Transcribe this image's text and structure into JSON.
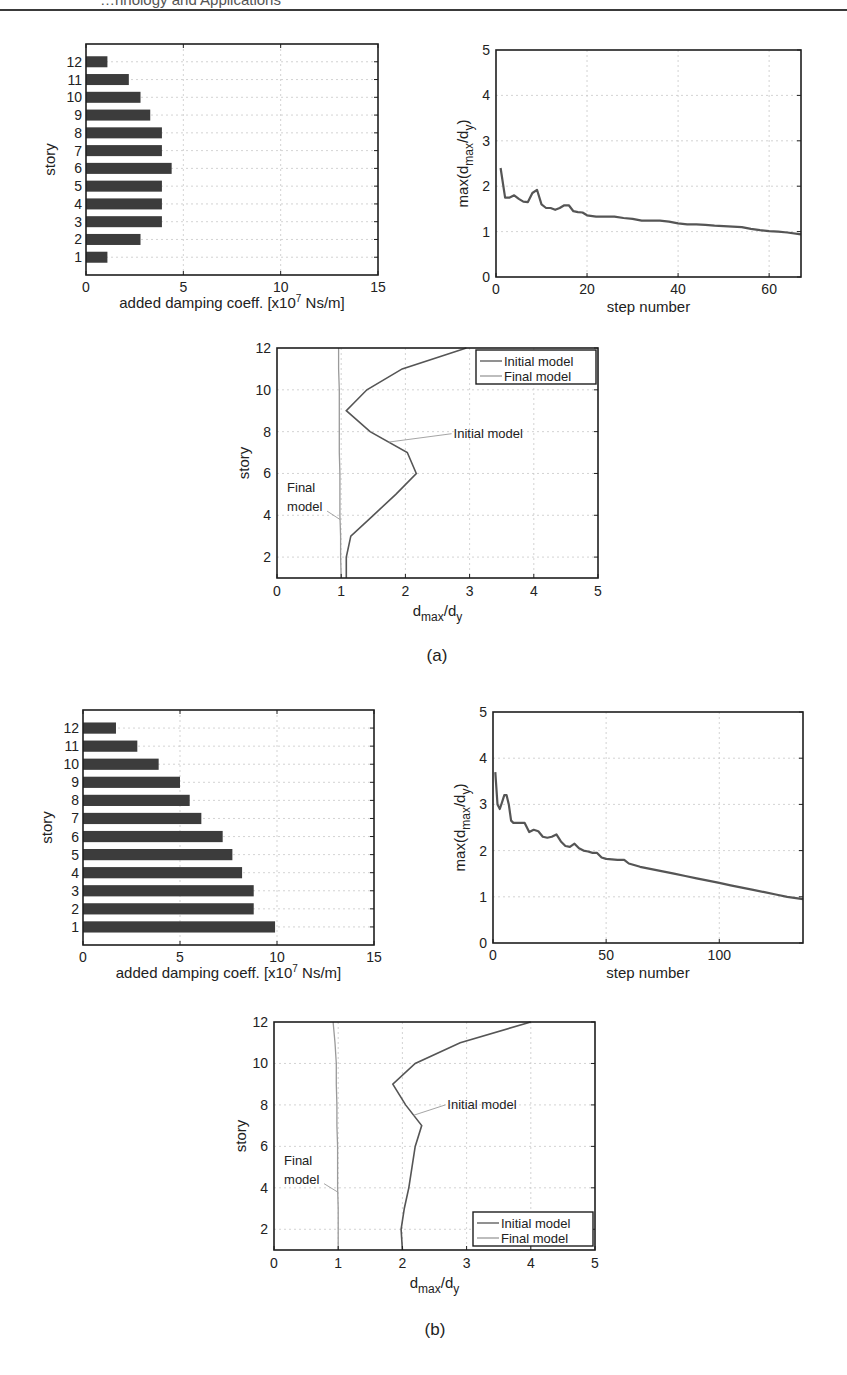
{
  "page": {
    "header_text": "…hnology and Applications",
    "figure_a_caption": "(a)",
    "figure_b_caption": "(b)"
  },
  "chart_data": [
    {
      "id": "a_bar",
      "panel": "a",
      "type": "bar",
      "orientation": "horizontal",
      "title": "",
      "xlabel": "added damping coeff. [x10^7 Ns/m]",
      "ylabel": "story",
      "xlim": [
        0,
        15
      ],
      "xticks": [
        0,
        5,
        10,
        15
      ],
      "categories": [
        "1",
        "2",
        "3",
        "4",
        "5",
        "6",
        "7",
        "8",
        "9",
        "10",
        "11",
        "12"
      ],
      "values": [
        1.1,
        2.8,
        3.9,
        3.9,
        3.9,
        4.4,
        3.9,
        3.9,
        3.3,
        2.8,
        2.2,
        1.1
      ],
      "grid": true,
      "box": {
        "left": 86,
        "top": 44,
        "right": 378,
        "bottom": 275
      }
    },
    {
      "id": "a_line",
      "panel": "a",
      "type": "line",
      "xlabel": "step number",
      "ylabel": "max(d_max/d_y)",
      "xlim": [
        0,
        67
      ],
      "ylim": [
        0,
        5
      ],
      "xticks": [
        0,
        20,
        40,
        60
      ],
      "yticks": [
        0,
        1,
        2,
        3,
        4,
        5
      ],
      "grid": true,
      "x": [
        1,
        2,
        3,
        4,
        5,
        6,
        7,
        8,
        9,
        10,
        11,
        12,
        13,
        14,
        15,
        16,
        17,
        18,
        19,
        20,
        22,
        24,
        26,
        28,
        30,
        32,
        34,
        36,
        38,
        40,
        42,
        44,
        46,
        48,
        50,
        52,
        54,
        56,
        58,
        60,
        62,
        64,
        67
      ],
      "values": [
        2.4,
        1.75,
        1.75,
        1.8,
        1.72,
        1.66,
        1.65,
        1.85,
        1.92,
        1.6,
        1.52,
        1.52,
        1.48,
        1.52,
        1.58,
        1.58,
        1.45,
        1.43,
        1.42,
        1.36,
        1.33,
        1.33,
        1.33,
        1.3,
        1.28,
        1.24,
        1.24,
        1.24,
        1.22,
        1.18,
        1.16,
        1.16,
        1.15,
        1.13,
        1.12,
        1.11,
        1.1,
        1.06,
        1.03,
        1.01,
        1.0,
        0.98,
        0.94
      ],
      "box": {
        "left": 496,
        "top": 50,
        "right": 801,
        "bottom": 277
      }
    },
    {
      "id": "a_profile",
      "panel": "a",
      "type": "line",
      "xlabel": "d_max/d_y",
      "ylabel": "story",
      "xlim": [
        0,
        5
      ],
      "ylim": [
        1,
        12
      ],
      "xticks": [
        0,
        1,
        2,
        3,
        4,
        5
      ],
      "yticks": [
        2,
        4,
        6,
        8,
        10,
        12
      ],
      "grid": true,
      "legend": {
        "position": "upper right",
        "entries": [
          "Initial model",
          "Final model"
        ]
      },
      "annotations": [
        {
          "text": "Initial model",
          "at": [
            2.75,
            7.9
          ]
        },
        {
          "text": "Final",
          "at": [
            0.25,
            5.3
          ]
        },
        {
          "text": "model",
          "at": [
            0.25,
            4.4
          ]
        }
      ],
      "y": [
        1,
        2,
        3,
        4,
        5,
        6,
        7,
        8,
        9,
        10,
        11,
        12
      ],
      "series": [
        {
          "name": "Initial model",
          "values": [
            1.08,
            1.08,
            1.15,
            1.5,
            1.85,
            2.17,
            2.03,
            1.45,
            1.08,
            1.4,
            1.95,
            2.95
          ]
        },
        {
          "name": "Final model",
          "values": [
            1.0,
            0.99,
            0.99,
            0.98,
            0.98,
            0.98,
            0.97,
            0.97,
            0.97,
            0.97,
            0.96,
            0.96
          ]
        }
      ],
      "box": {
        "left": 277,
        "top": 348,
        "right": 598,
        "bottom": 578
      }
    },
    {
      "id": "b_bar",
      "panel": "b",
      "type": "bar",
      "orientation": "horizontal",
      "xlabel": "added damping coeff. [x10^7 Ns/m]",
      "ylabel": "story",
      "xlim": [
        0,
        15
      ],
      "xticks": [
        0,
        5,
        10,
        15
      ],
      "categories": [
        "1",
        "2",
        "3",
        "4",
        "5",
        "6",
        "7",
        "8",
        "9",
        "10",
        "11",
        "12"
      ],
      "values": [
        9.9,
        8.8,
        8.8,
        8.2,
        7.7,
        7.2,
        6.1,
        5.5,
        5.0,
        3.9,
        2.8,
        1.7
      ],
      "grid": true,
      "box": {
        "left": 83,
        "top": 710,
        "right": 374,
        "bottom": 945
      }
    },
    {
      "id": "b_line",
      "panel": "b",
      "type": "line",
      "xlabel": "step number",
      "ylabel": "max(d_max/d_y)",
      "xlim": [
        0,
        137
      ],
      "ylim": [
        0,
        5
      ],
      "xticks": [
        0,
        50,
        100
      ],
      "yticks": [
        0,
        1,
        2,
        3,
        4,
        5
      ],
      "grid": true,
      "x": [
        1,
        2,
        3,
        4,
        5,
        6,
        7,
        8,
        9,
        10,
        12,
        14,
        16,
        18,
        20,
        22,
        24,
        26,
        28,
        30,
        32,
        34,
        36,
        38,
        40,
        42,
        44,
        46,
        48,
        50,
        55,
        58,
        60,
        65,
        70,
        75,
        80,
        85,
        90,
        95,
        100,
        105,
        110,
        115,
        120,
        125,
        130,
        137
      ],
      "values": [
        3.7,
        3.0,
        2.9,
        3.05,
        3.2,
        3.2,
        3.0,
        2.65,
        2.6,
        2.6,
        2.6,
        2.6,
        2.4,
        2.45,
        2.42,
        2.3,
        2.28,
        2.3,
        2.35,
        2.2,
        2.1,
        2.08,
        2.15,
        2.05,
        2.0,
        1.98,
        1.95,
        1.95,
        1.85,
        1.82,
        1.8,
        1.8,
        1.72,
        1.65,
        1.6,
        1.55,
        1.5,
        1.45,
        1.4,
        1.35,
        1.3,
        1.25,
        1.2,
        1.15,
        1.1,
        1.05,
        1.0,
        0.95
      ],
      "box": {
        "left": 493,
        "top": 712,
        "right": 803,
        "bottom": 943
      }
    },
    {
      "id": "b_profile",
      "panel": "b",
      "type": "line",
      "xlabel": "d_max/d_y",
      "ylabel": "story",
      "xlim": [
        0,
        5
      ],
      "ylim": [
        1,
        12
      ],
      "xticks": [
        0,
        1,
        2,
        3,
        4,
        5
      ],
      "yticks": [
        2,
        4,
        6,
        8,
        10,
        12
      ],
      "grid": true,
      "legend": {
        "position": "lower right",
        "entries": [
          "Initial model",
          "Final model"
        ]
      },
      "annotations": [
        {
          "text": "Initial model",
          "at": [
            2.7,
            8.0
          ]
        },
        {
          "text": "Final",
          "at": [
            0.25,
            5.3
          ]
        },
        {
          "text": "model",
          "at": [
            0.25,
            4.4
          ]
        }
      ],
      "y": [
        1,
        2,
        3,
        4,
        5,
        6,
        7,
        8,
        9,
        10,
        11,
        12
      ],
      "series": [
        {
          "name": "Initial model",
          "values": [
            2.0,
            1.98,
            2.03,
            2.1,
            2.15,
            2.2,
            2.3,
            2.05,
            1.85,
            2.2,
            2.9,
            4.0
          ]
        },
        {
          "name": "Final model",
          "values": [
            1.0,
            1.0,
            1.0,
            0.99,
            0.99,
            0.99,
            0.98,
            0.98,
            0.97,
            0.97,
            0.95,
            0.92
          ]
        }
      ],
      "box": {
        "left": 274,
        "top": 1022,
        "right": 595,
        "bottom": 1250
      }
    }
  ],
  "colors": {
    "axis": "#1e1e1e",
    "bar": "#3c3c3c",
    "initial_line": "#555555",
    "final_line": "#9a9a9a",
    "grid": "#c8c8c8"
  }
}
